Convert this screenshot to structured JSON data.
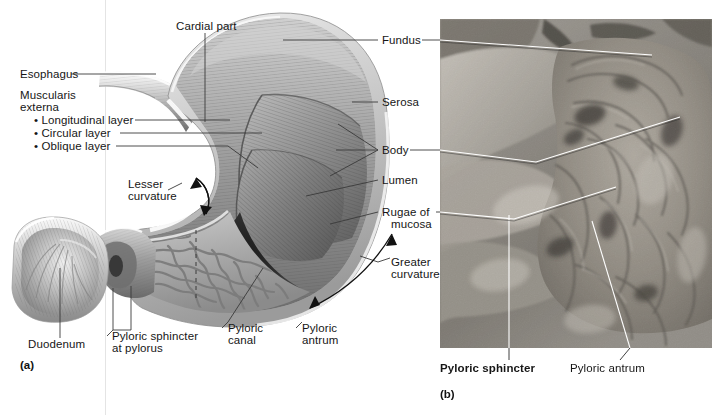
{
  "figure": {
    "panels": [
      {
        "id": "a",
        "caption": "(a)",
        "type": "illustration"
      },
      {
        "id": "b",
        "caption": "(b)",
        "type": "cadaver-photograph"
      }
    ]
  },
  "palette": {
    "background": "#ffffff",
    "text": "#161616",
    "leader_line": "#3a3a3a",
    "photo_leader_line": "#ffffff",
    "serosa": "#d8d8d8",
    "muscularis": "#8e8e8e",
    "mucosa": "#b5b5b5",
    "lumen_dark": "#2a2a2a",
    "rugae": "#9e9e9e",
    "page_rule": "#e4e4e4"
  },
  "panel_a": {
    "caption": "(a)",
    "labels": {
      "cardial_part": "Cardial part",
      "esophagus": "Esophagus",
      "muscularis_externa": {
        "line1": "Muscularis",
        "line2": "externa"
      },
      "muscle_layers": [
        "• Longitudinal layer",
        "• Circular layer",
        "• Oblique layer"
      ],
      "lesser_curvature": {
        "line1": "Lesser",
        "line2": "curvature"
      },
      "duodenum": "Duodenum",
      "pyloric_sphincter_at_pylorus": {
        "line1": "Pyloric sphincter",
        "line2": "at pylorus"
      },
      "pyloric_canal": {
        "line1": "Pyloric",
        "line2": "canal"
      },
      "pyloric_antrum": {
        "line1": "Pyloric",
        "line2": "antrum"
      },
      "fundus": "Fundus",
      "serosa": "Serosa",
      "body": "Body",
      "lumen": "Lumen",
      "rugae_of_mucosa": {
        "line1": "Rugae of",
        "line2": "mucosa"
      },
      "greater_curvature": {
        "line1": "Greater",
        "line2": "curvature"
      }
    }
  },
  "panel_b": {
    "caption": "(b)",
    "labels": {
      "pyloric_sphincter": "Pyloric sphincter",
      "pyloric_antrum": "Pyloric antrum"
    },
    "shared_labels_from_panel_a": [
      "Fundus",
      "Body",
      "Rugae of mucosa"
    ]
  }
}
